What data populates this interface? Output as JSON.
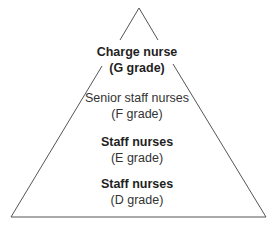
{
  "diagram": {
    "type": "pyramid",
    "stroke_color": "#555555",
    "levels": [
      {
        "title": "Charge nurse",
        "grade": "(G grade)",
        "title_bold": true
      },
      {
        "title": "Senior staff nurses",
        "grade": "(F grade)",
        "title_bold": false
      },
      {
        "title": "Staff nurses",
        "grade": "(E grade)",
        "title_bold": true
      },
      {
        "title": "Staff nurses",
        "grade": "(D grade)",
        "title_bold": true
      }
    ]
  }
}
